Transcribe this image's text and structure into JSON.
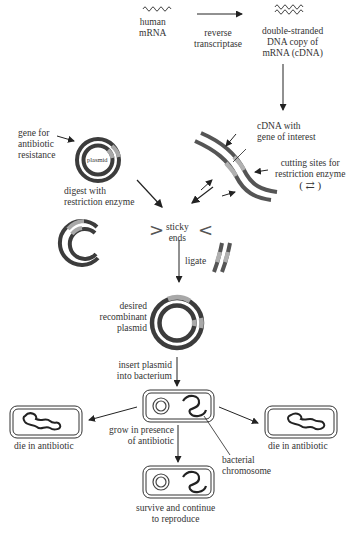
{
  "diagram": {
    "type": "recombinant DNA cloning workflow",
    "colors": {
      "dna_dark": "#3c3c3c",
      "gene_light": "#a8a8a8",
      "arrow": "#222222",
      "text": "#333333"
    },
    "top": {
      "mrna_label": [
        "human",
        "mRNA"
      ],
      "rt_label": [
        "reverse",
        "transcriptase"
      ],
      "cdna_label": [
        "double-stranded",
        "DNA copy of",
        "mRNA (cDNA)"
      ]
    },
    "cdna": {
      "label": [
        "cDNA with",
        "gene of interest"
      ],
      "cutting_label": [
        "cutting sites for",
        "restriction enzyme"
      ],
      "cutting_symbol": "( ⇄ )"
    },
    "plasmid": {
      "inner_label": "plasmid",
      "gene_label": [
        "gene for",
        "antibiotic",
        "resistance"
      ],
      "digest_label": [
        "digest with",
        "restriction enzyme"
      ]
    },
    "sticky": {
      "label": [
        "sticky",
        "ends"
      ],
      "left_bracket": ">",
      "right_bracket": "<"
    },
    "ligate_label": "ligate",
    "recombinant_label": [
      "desired",
      "recombinant",
      "plasmid"
    ],
    "insert_label": [
      "insert plasmid",
      "into bacterium"
    ],
    "grow_label": [
      "grow in presence",
      "of antibiotic"
    ],
    "chromosome_label": [
      "bacterial",
      "chromosome"
    ],
    "die_left_label": "die in antibiotic",
    "die_right_label": "die in antibiotic",
    "survive_label": [
      "survive and continue",
      "to reproduce"
    ]
  }
}
